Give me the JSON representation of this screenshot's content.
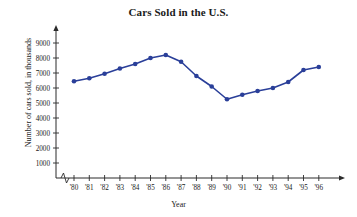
{
  "chart_data": {
    "type": "line",
    "title": "Cars Sold in the U.S.",
    "xlabel": "Year",
    "ylabel": "Number of cars sold, in thousands",
    "categories": [
      "'80",
      "'81",
      "'82",
      "'83",
      "'84",
      "'85",
      "'86",
      "'87",
      "'88",
      "'89",
      "'90",
      "'91",
      "'92",
      "'93",
      "'94",
      "'95",
      "'96"
    ],
    "values": [
      6450,
      6650,
      6950,
      7300,
      7600,
      8000,
      8200,
      7750,
      6800,
      6100,
      5250,
      5550,
      5800,
      6000,
      6400,
      7200,
      7400
    ],
    "ylim": [
      0,
      9500
    ],
    "yticks": [
      1000,
      2000,
      3000,
      4000,
      5000,
      6000,
      7000,
      8000,
      9000
    ],
    "ytick_labels": [
      "1000",
      "2000",
      "3000",
      "4000",
      "5000",
      "6000",
      "7000",
      "8000",
      "9000"
    ],
    "grid": false,
    "legend": null,
    "axis_break": true,
    "series_color": "#2a3f99",
    "axis_color": "#2b2b2b"
  }
}
